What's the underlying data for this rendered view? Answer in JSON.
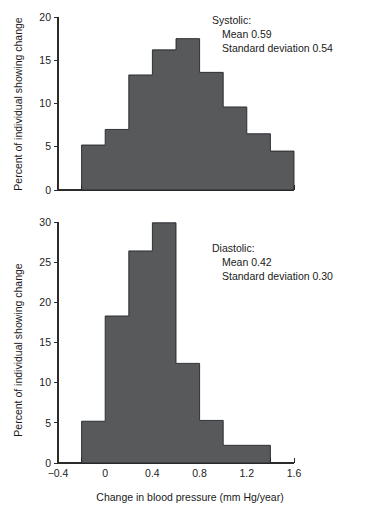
{
  "figure": {
    "background_color": "#ffffff",
    "bar_fill_color": "#57595b",
    "bar_edge_color": "#23262a",
    "axis_color": "#2b2b2b",
    "shared_xlabel": "Change in blood pressure (mm Hg/year)",
    "shared_ylabel": "Percent of individual showing change"
  },
  "chart_data": [
    {
      "type": "bar",
      "id": "systolic-histogram",
      "title": "",
      "panel_label": "Systolic:",
      "annotations": [
        "Systolic:",
        "Mean 0.59",
        "Standard deviation 0.54"
      ],
      "stats": {
        "name": "Systolic",
        "mean": 0.59,
        "standard_deviation": 0.54
      },
      "xlabel": "Change in blood pressure (mm Hg/year)",
      "ylabel": "Percent of individual showing change",
      "xlim": [
        -0.4,
        1.6
      ],
      "ylim": [
        0,
        20
      ],
      "xticks": [
        -0.4,
        0,
        0.4,
        0.8,
        1.2,
        1.6
      ],
      "xticklabels": [
        "-0.4",
        "0",
        "0.4",
        "0.8",
        "1.2",
        "1.6"
      ],
      "xminorticks": [
        -0.2,
        0.2,
        0.6,
        1.0,
        1.4
      ],
      "yticks": [
        0,
        5,
        10,
        15,
        20
      ],
      "yticklabels": [
        "0",
        "5",
        "10",
        "15",
        "20"
      ],
      "grid": false,
      "legend": "none",
      "bin_edges": [
        -0.2,
        0.0,
        0.2,
        0.4,
        0.6,
        0.8,
        1.0,
        1.2,
        1.6
      ],
      "bin_labels": [
        "-0.2 to 0.0",
        "0.0 to 0.2",
        "0.2 to 0.4",
        "0.4 to 0.6",
        "0.6 to 0.8",
        "0.8 to 1.0",
        "1.0 to 1.2",
        "1.2 to 1.6"
      ],
      "values": [
        5.2,
        7.0,
        13.3,
        16.2,
        17.5,
        13.6,
        9.6,
        6.5
      ],
      "extra_bins": [
        {
          "range": [
            1.2,
            1.4
          ],
          "value": 4.5
        },
        {
          "range": [
            1.4,
            1.6
          ],
          "value": 2.3
        }
      ],
      "bars": [
        {
          "x0": -0.2,
          "x1": 0.0,
          "value": 5.2
        },
        {
          "x0": 0.0,
          "x1": 0.2,
          "value": 7.0
        },
        {
          "x0": 0.2,
          "x1": 0.4,
          "value": 13.3
        },
        {
          "x0": 0.4,
          "x1": 0.6,
          "value": 16.2
        },
        {
          "x0": 0.6,
          "x1": 0.8,
          "value": 17.5
        },
        {
          "x0": 0.8,
          "x1": 1.0,
          "value": 13.6
        },
        {
          "x0": 1.0,
          "x1": 1.2,
          "value": 9.6
        },
        {
          "x0": 1.2,
          "x1": 1.4,
          "value": 6.5
        },
        {
          "x0": 1.4,
          "x1": 1.6,
          "value": 4.5
        },
        {
          "x0": 1.6,
          "x1": 2.0,
          "value": 2.3
        }
      ]
    },
    {
      "type": "bar",
      "id": "diastolic-histogram",
      "title": "",
      "panel_label": "Diastolic:",
      "annotations": [
        "Diastolic:",
        "Mean 0.42",
        "Standard deviation 0.30"
      ],
      "stats": {
        "name": "Diastolic",
        "mean": 0.42,
        "standard_deviation": 0.3
      },
      "xlabel": "Change in blood pressure (mm Hg/year)",
      "ylabel": "Percent of individual showing change",
      "xlim": [
        -0.4,
        1.6
      ],
      "ylim": [
        0,
        30
      ],
      "xticks": [
        -0.4,
        0,
        0.4,
        0.8,
        1.2,
        1.6
      ],
      "xticklabels": [
        "-0.4",
        "0",
        "0.4",
        "0.8",
        "1.2",
        "1.6"
      ],
      "xminorticks": [
        -0.2,
        0.2,
        0.6,
        1.0,
        1.4
      ],
      "yticks": [
        0,
        5,
        10,
        15,
        20,
        25,
        30
      ],
      "yticklabels": [
        "0",
        "5",
        "10",
        "15",
        "20",
        "25",
        "30"
      ],
      "grid": false,
      "legend": "none",
      "bin_edges": [
        -0.2,
        0.0,
        0.2,
        0.4,
        0.6,
        0.8,
        1.0,
        1.4
      ],
      "bin_labels": [
        "-0.2 to 0.0",
        "0.0 to 0.2",
        "0.2 to 0.4",
        "0.4 to 0.6",
        "0.6 to 0.8",
        "0.8 to 1.0",
        "1.0 to 1.4"
      ],
      "values": [
        5.2,
        18.3,
        26.4,
        29.9,
        12.4,
        5.3,
        2.2
      ],
      "bars": [
        {
          "x0": -0.2,
          "x1": 0.0,
          "value": 5.2
        },
        {
          "x0": 0.0,
          "x1": 0.2,
          "value": 18.3
        },
        {
          "x0": 0.2,
          "x1": 0.4,
          "value": 26.4
        },
        {
          "x0": 0.4,
          "x1": 0.6,
          "value": 29.9
        },
        {
          "x0": 0.6,
          "x1": 0.8,
          "value": 12.4
        },
        {
          "x0": 0.8,
          "x1": 1.0,
          "value": 5.3
        },
        {
          "x0": 1.0,
          "x1": 1.4,
          "value": 2.2
        }
      ]
    }
  ]
}
